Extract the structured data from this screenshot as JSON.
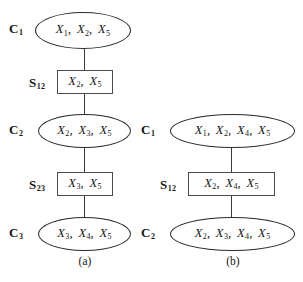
{
  "figure": {
    "type": "junction-tree-diagram",
    "background_color": "#ffffff",
    "line_color": "#2b2b2b",
    "text_color": "#141414"
  },
  "subfigures": [
    {
      "caption": "(a)",
      "nodes": [
        {
          "label": "C",
          "subscript": "1",
          "kind": "clique",
          "variables": "X1, X2, X5"
        },
        {
          "label": "S",
          "subscript": "12",
          "kind": "separator",
          "variables": "X2, X5"
        },
        {
          "label": "C",
          "subscript": "2",
          "kind": "clique",
          "variables": "X2, X3, X5"
        },
        {
          "label": "S",
          "subscript": "23",
          "kind": "separator",
          "variables": "X3, X5"
        },
        {
          "label": "C",
          "subscript": "3",
          "kind": "clique",
          "variables": "X3, X4, X5"
        }
      ]
    },
    {
      "caption": "(b)",
      "nodes": [
        {
          "label": "C",
          "subscript": "1",
          "kind": "clique",
          "variables": "X1, X2, X4, X5"
        },
        {
          "label": "S",
          "subscript": "12",
          "kind": "separator",
          "variables": "X2, X4, X5"
        },
        {
          "label": "C",
          "subscript": "2",
          "kind": "clique",
          "variables": "X2, X3, X4, X5"
        }
      ]
    }
  ],
  "a": {
    "caption": "(a)",
    "n0": {
      "label": "C",
      "sub": "1",
      "vars": [
        "1",
        "2",
        "5"
      ]
    },
    "n1": {
      "label": "S",
      "sub": "12",
      "vars": [
        "2",
        "5"
      ]
    },
    "n2": {
      "label": "C",
      "sub": "2",
      "vars": [
        "2",
        "3",
        "5"
      ]
    },
    "n3": {
      "label": "S",
      "sub": "23",
      "vars": [
        "3",
        "5"
      ]
    },
    "n4": {
      "label": "C",
      "sub": "3",
      "vars": [
        "3",
        "4",
        "5"
      ]
    }
  },
  "b": {
    "caption": "(b)",
    "n0": {
      "label": "C",
      "sub": "1",
      "vars": [
        "1",
        "2",
        "4",
        "5"
      ]
    },
    "n1": {
      "label": "S",
      "sub": "12",
      "vars": [
        "2",
        "4",
        "5"
      ]
    },
    "n2": {
      "label": "C",
      "sub": "2",
      "vars": [
        "2",
        "3",
        "4",
        "5"
      ]
    }
  },
  "variable_symbol": "X"
}
